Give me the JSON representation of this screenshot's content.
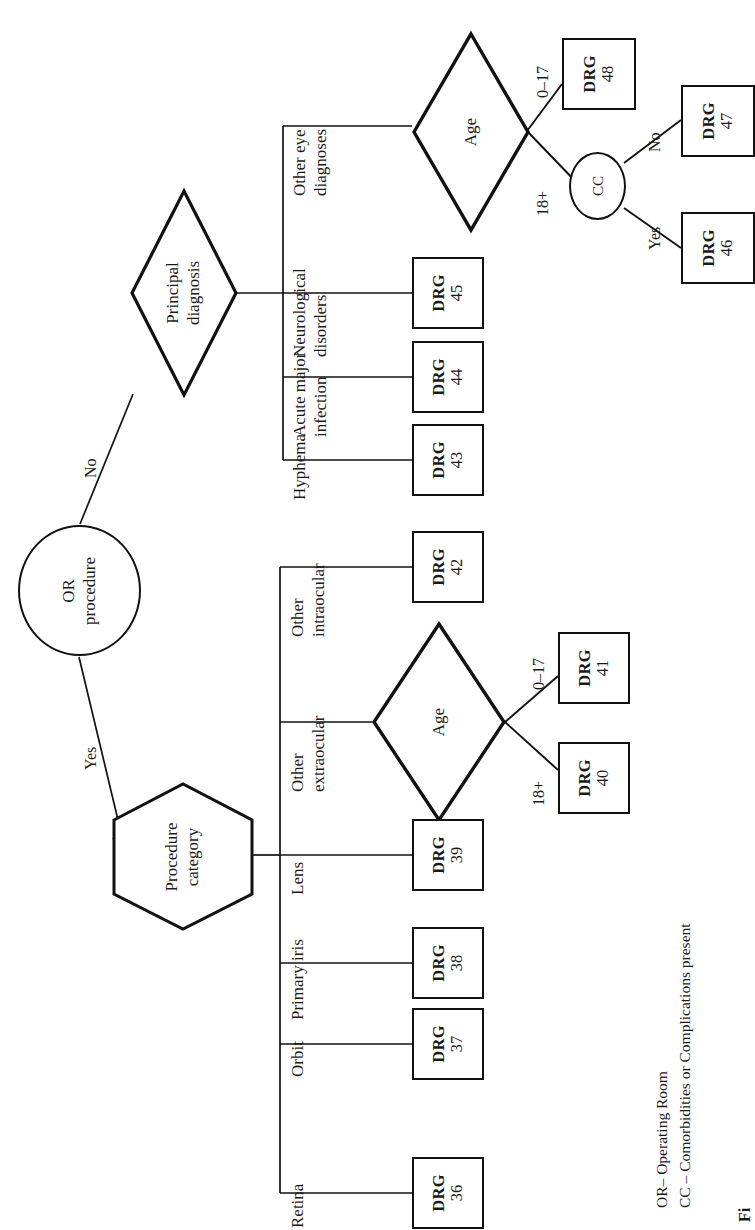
{
  "figure": {
    "type": "decision-tree",
    "orientation": "rotated-90-ccw",
    "caption_partial": "Fi"
  },
  "legend": {
    "line1": "OR– Operating Room",
    "line2": "CC – Comorbidities or Complications present"
  },
  "nodes": {
    "or_procedure": {
      "line1": "OR",
      "line2": "procedure",
      "shape": "circle"
    },
    "principal_diagnosis": {
      "line1": "Principal",
      "line2": "diagnosis",
      "shape": "diamond"
    },
    "procedure_category": {
      "line1": "Procedure",
      "line2": "category",
      "shape": "hexagon"
    },
    "age_upper": {
      "line1": "Age",
      "shape": "diamond"
    },
    "age_lower": {
      "line1": "Age",
      "shape": "diamond"
    },
    "cc": {
      "line1": "CC",
      "shape": "circle"
    }
  },
  "edges": {
    "or_no": "No",
    "or_yes": "Yes",
    "age_upper_young": "0–17",
    "age_upper_adult": "18+",
    "age_lower_young": "0–17",
    "age_lower_adult": "18+",
    "cc_no": "No",
    "cc_yes": "Yes"
  },
  "branches": {
    "diagnosis": [
      {
        "label_line1": "Other eye",
        "label_line2": "diagnoses"
      },
      {
        "label_line1": "Neurological",
        "label_line2": "disorders"
      },
      {
        "label_line1": "Acute major",
        "label_line2": "infection"
      },
      {
        "label_line1": "Hyphema",
        "label_line2": ""
      }
    ],
    "procedure": [
      {
        "label_line1": "Other",
        "label_line2": "intraocular"
      },
      {
        "label_line1": "Other",
        "label_line2": "extraocular"
      },
      {
        "label_line1": "Lens",
        "label_line2": ""
      },
      {
        "label_line1": "Primary iris",
        "label_line2": ""
      },
      {
        "label_line1": "Orbit",
        "label_line2": ""
      },
      {
        "label_line1": "Retina",
        "label_line2": ""
      }
    ]
  },
  "drgs": [
    {
      "id": "drg-48",
      "prefix": "DRG",
      "number": "48"
    },
    {
      "id": "drg-47",
      "prefix": "DRG",
      "number": "47"
    },
    {
      "id": "drg-46",
      "prefix": "DRG",
      "number": "46"
    },
    {
      "id": "drg-45",
      "prefix": "DRG",
      "number": "45"
    },
    {
      "id": "drg-44",
      "prefix": "DRG",
      "number": "44"
    },
    {
      "id": "drg-43",
      "prefix": "DRG",
      "number": "43"
    },
    {
      "id": "drg-42",
      "prefix": "DRG",
      "number": "42"
    },
    {
      "id": "drg-41",
      "prefix": "DRG",
      "number": "41"
    },
    {
      "id": "drg-40",
      "prefix": "DRG",
      "number": "40"
    },
    {
      "id": "drg-39",
      "prefix": "DRG",
      "number": "39"
    },
    {
      "id": "drg-38",
      "prefix": "DRG",
      "number": "38"
    },
    {
      "id": "drg-37",
      "prefix": "DRG",
      "number": "37"
    },
    {
      "id": "drg-36",
      "prefix": "DRG",
      "number": "36"
    }
  ],
  "colors": {
    "ink": "#111111",
    "paper": "#ffffff"
  }
}
